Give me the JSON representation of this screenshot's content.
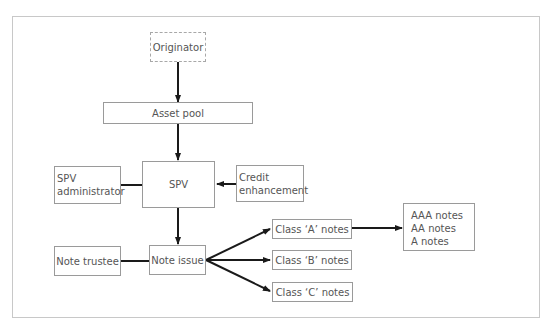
{
  "diagram": {
    "type": "flowchart",
    "title": "",
    "nodes": {
      "originator": {
        "label": "Originator",
        "style": "dashed"
      },
      "asset_pool": {
        "label": "Asset pool"
      },
      "spv": {
        "label": "SPV"
      },
      "spv_admin": {
        "line1": "SPV",
        "line2": "administrator"
      },
      "credit_enh": {
        "line1": "Credit",
        "line2": "enhancement"
      },
      "note_issue": {
        "label": "Note issue"
      },
      "note_trustee": {
        "label": "Note trustee"
      },
      "class_a": {
        "label": "Class ‘A’ notes"
      },
      "class_b": {
        "label": "Class ‘B’ notes"
      },
      "class_c": {
        "label": "Class ‘C’ notes"
      },
      "ratings": {
        "line1": "AAA notes",
        "line2": "AA notes",
        "line3": "A notes"
      }
    },
    "edges": [
      {
        "from": "Originator",
        "to": "Asset pool",
        "arrow": true
      },
      {
        "from": "Asset pool",
        "to": "SPV",
        "arrow": true
      },
      {
        "from": "SPV administrator",
        "to": "SPV",
        "arrow": false
      },
      {
        "from": "Credit enhancement",
        "to": "SPV",
        "arrow": true
      },
      {
        "from": "SPV",
        "to": "Note issue",
        "arrow": true
      },
      {
        "from": "Note trustee",
        "to": "Note issue",
        "arrow": false
      },
      {
        "from": "Note issue",
        "to": "Class ‘A’ notes",
        "arrow": true
      },
      {
        "from": "Note issue",
        "to": "Class ‘B’ notes",
        "arrow": true
      },
      {
        "from": "Note issue",
        "to": "Class ‘C’ notes",
        "arrow": true
      },
      {
        "from": "Class ‘A’ notes",
        "to": "AAA notes / AA notes / A notes",
        "arrow": true
      }
    ],
    "colors": {
      "line": "#1a1a1a",
      "box_border": "#9a9a9a",
      "frame": "#c8c8c8",
      "text": "#555555"
    }
  }
}
